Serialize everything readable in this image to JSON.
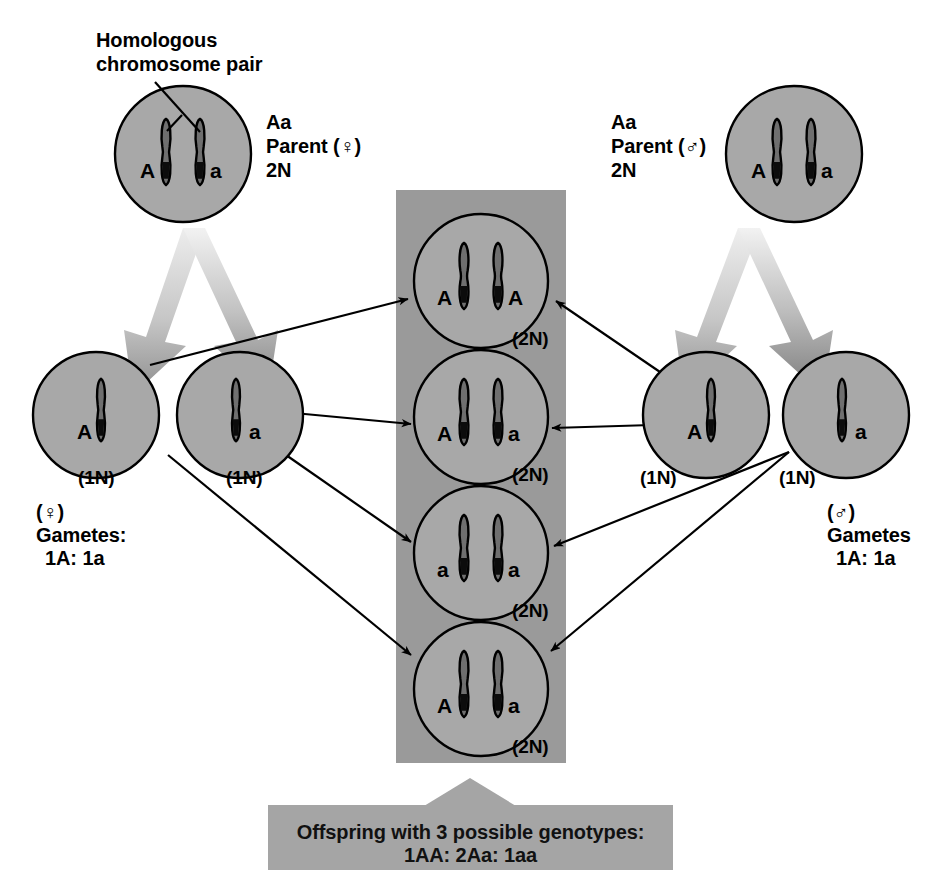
{
  "diagram": {
    "title_annotation": "Homologous\nchromosome pair",
    "colors": {
      "cell_fill": "#a8a8a8",
      "column_fill": "#9a9a9a",
      "caption_fill": "#a5a5a5",
      "outline": "#000000",
      "arrow_light": "#e2e2e2",
      "arrow_dark": "#8f8f8f"
    }
  },
  "parents": [
    {
      "id": "female-parent",
      "genotype": "Aa",
      "role": "Parent (♀)",
      "ploidy": "2N",
      "allele_left": "A",
      "allele_right": "a"
    },
    {
      "id": "male-parent",
      "genotype": "Aa",
      "role": "Parent (♂)",
      "ploidy": "2N",
      "allele_left": "A",
      "allele_right": "a"
    }
  ],
  "gametes": {
    "female": {
      "label_sex": "(♀)",
      "label_title": "Gametes:",
      "label_ratio": "1A: 1a",
      "cells": [
        {
          "allele": "A",
          "ploidy": "(1N)"
        },
        {
          "allele": "a",
          "ploidy": "(1N)"
        }
      ]
    },
    "male": {
      "label_sex": "(♂)",
      "label_title": "Gametes",
      "label_ratio": "1A: 1a",
      "cells": [
        {
          "allele": "A",
          "ploidy": "(1N)"
        },
        {
          "allele": "a",
          "ploidy": "(1N)"
        }
      ]
    }
  },
  "offspring": [
    {
      "allele_left": "A",
      "allele_right": "A",
      "ploidy": "(2N)",
      "genotype": "AA"
    },
    {
      "allele_left": "A",
      "allele_right": "a",
      "ploidy": "(2N)",
      "genotype": "Aa"
    },
    {
      "allele_left": "a",
      "allele_right": "a",
      "ploidy": "(2N)",
      "genotype": "aa"
    },
    {
      "allele_left": "A",
      "allele_right": "a",
      "ploidy": "(2N)",
      "genotype": "Aa"
    }
  ],
  "caption": {
    "line1": "Offspring with 3 possible genotypes:",
    "line2": "1AA: 2Aa: 1aa"
  }
}
